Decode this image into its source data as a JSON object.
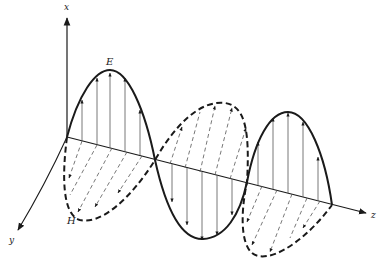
{
  "diagram": {
    "axes": {
      "x_label": "x",
      "y_label": "y",
      "z_label": "z"
    },
    "fields": {
      "electric_label": "E",
      "magnetic_label": "H"
    },
    "colors": {
      "line": "#1a1a1a",
      "hatch": "#555555",
      "background": "#ffffff"
    }
  }
}
